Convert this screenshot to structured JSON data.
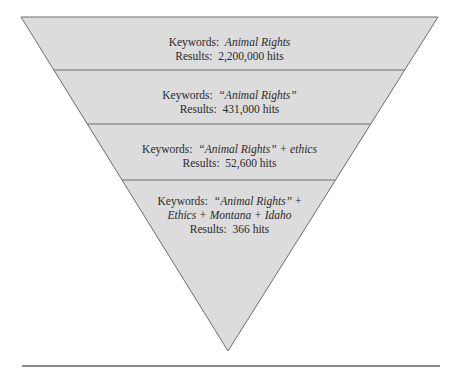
{
  "diagram": {
    "type": "inverted-funnel",
    "colors": {
      "fill": "#dcdcdc",
      "stroke": "#6e6e6e",
      "text": "#2a2a2a",
      "rule": "#8a8a8a"
    },
    "levels": [
      {
        "keywords_label": "Keywords:",
        "keywords": "Animal Rights",
        "results_label": "Results:",
        "results": "2,200,000 hits"
      },
      {
        "keywords_label": "Keywords:",
        "keywords": "“Animal Rights”",
        "results_label": "Results:",
        "results": "431,000 hits"
      },
      {
        "keywords_label": "Keywords:",
        "keywords": "“Animal Rights”",
        "keywords_extra": "+ ethics",
        "results_label": "Results:",
        "results": "52,600 hits"
      },
      {
        "keywords_label": "Keywords:",
        "keywords": "“Animal Rights”",
        "keywords_extra": "+",
        "keywords_line2": "Ethics + Montana + Idaho",
        "results_label": "Results:",
        "results": "366 hits"
      }
    ]
  }
}
